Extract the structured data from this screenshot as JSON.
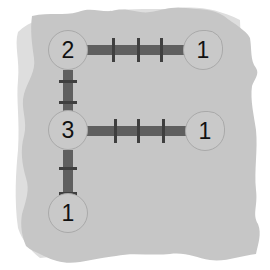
{
  "game": {
    "name": "Bridges",
    "colors": {
      "shadow": "#dedede",
      "board": "#c6c6c6",
      "node_fill": "#c9c9c9",
      "node_border": "#a9a9a9",
      "bridge": "#5f5f5f",
      "tick": "#3f3f3f",
      "number": "#111111"
    },
    "nodes": [
      {
        "id": "n1",
        "label": "2",
        "x": 68,
        "y": 50,
        "shape": "circle"
      },
      {
        "id": "n2",
        "label": "1",
        "x": 203,
        "y": 50,
        "shape": "teardrop"
      },
      {
        "id": "n3",
        "label": "3",
        "x": 68,
        "y": 130,
        "shape": "circle"
      },
      {
        "id": "n4",
        "label": "1",
        "x": 205,
        "y": 131,
        "shape": "teardrop"
      },
      {
        "id": "n5",
        "label": "1",
        "x": 68,
        "y": 213,
        "shape": "circle"
      }
    ],
    "bridges": [
      {
        "from": "n1",
        "to": "n2",
        "orientation": "horizontal",
        "ticks": 3
      },
      {
        "from": "n1",
        "to": "n3",
        "orientation": "vertical",
        "ticks": 2
      },
      {
        "from": "n3",
        "to": "n4",
        "orientation": "horizontal",
        "ticks": 3
      },
      {
        "from": "n3",
        "to": "n5",
        "orientation": "vertical",
        "ticks": 2
      }
    ]
  }
}
